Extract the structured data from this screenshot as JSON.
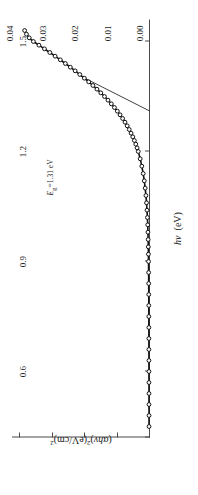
{
  "figure": {
    "orientation_deg": -90,
    "background": "#ffffff",
    "line_color": "#1a1a1a",
    "marker_color": "#111111",
    "axis_color": "#4a4a4a"
  },
  "axes": {
    "x_title": "hν  (eV)",
    "x_title_italic_part": "hν",
    "x_ticklabels": [
      "0.6",
      "0.9",
      "1.2",
      "1.5"
    ],
    "x_tickvalues": [
      0.6,
      0.9,
      1.2,
      1.5
    ],
    "x_range": [
      0.42,
      1.56
    ],
    "y_title": "(αhν)²(eV/cm)²",
    "y_ticklabels": [
      "0.00",
      "0.01",
      "0.02",
      "0.03",
      "0.04"
    ],
    "y_tickvalues": [
      0.0,
      0.01,
      0.02,
      0.03,
      0.04
    ],
    "y_range": [
      0.0,
      0.0425
    ]
  },
  "annotation": {
    "bandgap_label": "Eᵍ=1.31 eV",
    "bandgap_symbol": "E",
    "bandgap_subscript": "g",
    "bandgap_value": "1.31",
    "bandgap_unit": "eV"
  },
  "chart_data": {
    "type": "scatter",
    "title": "",
    "xlabel": "hν  (eV)",
    "ylabel": "(αhν)²(eV/cm)²",
    "xlim": [
      0.42,
      1.56
    ],
    "ylim": [
      0.0,
      0.0425
    ],
    "grid": false,
    "legend": null,
    "marker": "open-circle",
    "series": [
      {
        "name": "(αhν)² absorption data",
        "x": [
          0.45,
          0.48,
          0.51,
          0.54,
          0.57,
          0.6,
          0.63,
          0.66,
          0.69,
          0.72,
          0.75,
          0.78,
          0.81,
          0.84,
          0.87,
          0.9,
          0.92,
          0.94,
          0.96,
          0.98,
          1.0,
          1.02,
          1.04,
          1.06,
          1.08,
          1.1,
          1.12,
          1.14,
          1.16,
          1.18,
          1.2,
          1.21,
          1.22,
          1.23,
          1.24,
          1.25,
          1.26,
          1.27,
          1.28,
          1.29,
          1.3,
          1.31,
          1.32,
          1.33,
          1.34,
          1.35,
          1.36,
          1.37,
          1.38,
          1.39,
          1.4,
          1.41,
          1.42,
          1.43,
          1.44,
          1.45,
          1.46,
          1.47,
          1.48,
          1.49,
          1.5,
          1.51,
          1.52,
          1.53
        ],
        "y": [
          0.0003,
          0.0003,
          0.00031,
          0.00031,
          0.00032,
          0.00032,
          0.00033,
          0.00034,
          0.00034,
          0.00035,
          0.00036,
          0.00037,
          0.00038,
          0.0004,
          0.00042,
          0.00045,
          0.00048,
          0.00052,
          0.00057,
          0.00063,
          0.0007,
          0.0008,
          0.00092,
          0.00107,
          0.00125,
          0.00148,
          0.00176,
          0.0021,
          0.00252,
          0.00302,
          0.00362,
          0.00398,
          0.00438,
          0.00482,
          0.0053,
          0.00583,
          0.0064,
          0.00702,
          0.0077,
          0.00843,
          0.00922,
          0.01006,
          0.01096,
          0.01192,
          0.01294,
          0.01402,
          0.01515,
          0.01634,
          0.01758,
          0.01888,
          0.02022,
          0.02162,
          0.02306,
          0.02454,
          0.02606,
          0.02762,
          0.02922,
          0.03085,
          0.03251,
          0.0342,
          0.03592,
          0.0372,
          0.03805,
          0.0386
        ]
      }
    ],
    "annotations": [
      {
        "text": "Eᵍ=1.31 eV",
        "type": "tangent-extrapolation",
        "intercept_x": 1.31,
        "intercept_y": 0.0,
        "line_from": [
          1.31,
          0.0
        ],
        "line_to": [
          1.405,
          0.0212
        ]
      }
    ]
  }
}
